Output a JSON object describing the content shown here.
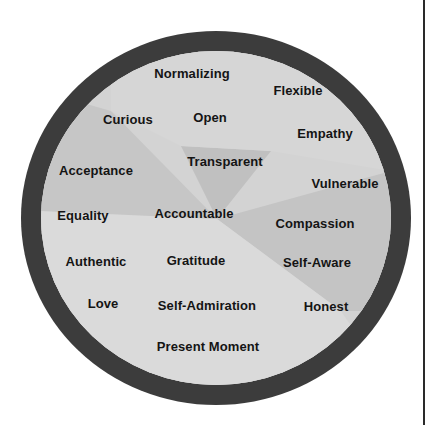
{
  "diagram": {
    "type": "word-circle",
    "colors": {
      "ring": "#3c3c3c",
      "fill": "#d2d2d2",
      "text": "#141414"
    },
    "words": [
      {
        "label": "Normalizing",
        "x": 192,
        "y": 73
      },
      {
        "label": "Flexible",
        "x": 298,
        "y": 90
      },
      {
        "label": "Curious",
        "x": 128,
        "y": 119
      },
      {
        "label": "Open",
        "x": 210,
        "y": 117
      },
      {
        "label": "Empathy",
        "x": 325,
        "y": 133
      },
      {
        "label": "Transparent",
        "x": 225,
        "y": 161
      },
      {
        "label": "Acceptance",
        "x": 96,
        "y": 170
      },
      {
        "label": "Vulnerable",
        "x": 345,
        "y": 183
      },
      {
        "label": "Equality",
        "x": 83,
        "y": 215
      },
      {
        "label": "Accountable",
        "x": 194,
        "y": 213
      },
      {
        "label": "Compassion",
        "x": 315,
        "y": 223
      },
      {
        "label": "Authentic",
        "x": 96,
        "y": 261
      },
      {
        "label": "Gratitude",
        "x": 196,
        "y": 260
      },
      {
        "label": "Self-Aware",
        "x": 317,
        "y": 262
      },
      {
        "label": "Love",
        "x": 103,
        "y": 303
      },
      {
        "label": "Self-Admiration",
        "x": 207,
        "y": 305
      },
      {
        "label": "Honest",
        "x": 326,
        "y": 306
      },
      {
        "label": "Present Moment",
        "x": 208,
        "y": 346
      }
    ]
  }
}
